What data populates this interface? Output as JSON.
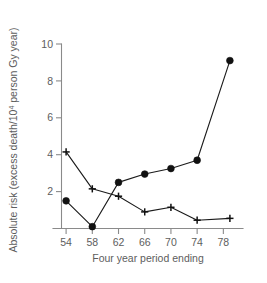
{
  "chart_data": {
    "type": "line",
    "title": "",
    "xlabel": "Four year period ending",
    "ylabel": "Absolute risk (excess death/10",
    "ylabel_sup": "4",
    "ylabel_tail": " person Gy year)",
    "xlim": [
      52,
      81
    ],
    "ylim": [
      0,
      10
    ],
    "grid": false,
    "legend": "none",
    "xticks": [
      "54",
      "58",
      "62",
      "66",
      "70",
      "74",
      "78"
    ],
    "xtick_values": [
      54,
      58,
      62,
      66,
      70,
      74,
      78
    ],
    "yticks": [
      "2",
      "4",
      "6",
      "8",
      "10"
    ],
    "ytick_values": [
      2,
      4,
      6,
      8,
      10
    ],
    "x": [
      54,
      58,
      62,
      66,
      70,
      74,
      79
    ],
    "series": [
      {
        "name": "filled-circle-series",
        "marker": "circle",
        "values": [
          1.5,
          0.1,
          2.5,
          2.95,
          3.25,
          3.7,
          9.1
        ]
      },
      {
        "name": "plus-series",
        "marker": "plus",
        "values": [
          4.15,
          2.15,
          1.75,
          0.9,
          1.15,
          0.45,
          0.55
        ]
      }
    ]
  }
}
